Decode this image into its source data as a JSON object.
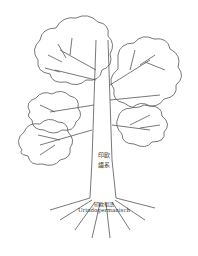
{
  "diagram": {
    "type": "language-family-tree",
    "trunk_label": "印欧語系",
    "root": {
      "label_cn": "印欧祖語",
      "label_de": "Urindogermanisch"
    },
    "canopies": [
      {
        "position": "upper-left",
        "branch_count": 7
      },
      {
        "position": "upper-right",
        "branch_count": 7
      },
      {
        "position": "middle-left",
        "branch_count": 3
      },
      {
        "position": "lower-left",
        "branch_count": 6
      },
      {
        "position": "lower-right",
        "branch_count": 5
      }
    ],
    "colors": {
      "line": "#555555",
      "background": "#ffffff"
    }
  }
}
